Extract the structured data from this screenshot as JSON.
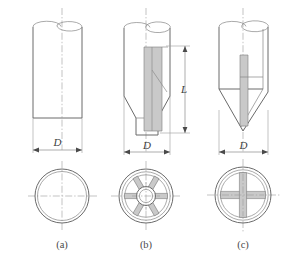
{
  "figure": {
    "background_color": "#ffffff",
    "line_color": "#6a6a6a",
    "centerline_color": "#9b9b9b",
    "dimension_color": "#8a8a8a",
    "vane_color": "#c9c9c9"
  },
  "panels": [
    {
      "id": "a",
      "caption": "(a)",
      "description": "Plain open-ended cylinder",
      "elevation": {
        "shape": "cylinder",
        "bottom": "open-square-cut",
        "has_internal_vanes": false
      },
      "dimensions": [
        {
          "name": "diameter",
          "label": "D",
          "orientation": "horizontal"
        }
      ],
      "plan": {
        "circles": 2,
        "spokes": 0,
        "hub": false,
        "crosshair": true
      }
    },
    {
      "id": "b",
      "caption": "(b)",
      "description": "Cylinder with conical reduction to spigot and internal radial vanes",
      "elevation": {
        "shape": "cylinder-cone-spigot",
        "bottom": "spigot",
        "has_internal_vanes": true
      },
      "dimensions": [
        {
          "name": "diameter",
          "label": "D",
          "orientation": "horizontal"
        },
        {
          "name": "length",
          "label": "L",
          "orientation": "vertical"
        }
      ],
      "plan": {
        "circles": 3,
        "spokes": 6,
        "hub": true,
        "crosshair": true
      }
    },
    {
      "id": "c",
      "caption": "(c)",
      "description": "Cylinder with sharp conical point and internal cross vanes",
      "elevation": {
        "shape": "cylinder-sharp-cone",
        "bottom": "point",
        "has_internal_vanes": true
      },
      "dimensions": [
        {
          "name": "diameter",
          "label": "D",
          "orientation": "horizontal"
        }
      ],
      "plan": {
        "circles": 3,
        "spokes": 4,
        "hub": false,
        "crosshair": true
      }
    }
  ],
  "labels": {
    "diameter_a": "D",
    "diameter_b": "D",
    "diameter_c": "D",
    "length_b": "L",
    "caption_a": "(a)",
    "caption_b": "(b)",
    "caption_c": "(c)"
  }
}
